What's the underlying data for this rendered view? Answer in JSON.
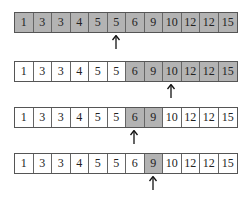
{
  "diagram": {
    "values": [
      1,
      3,
      3,
      4,
      5,
      5,
      6,
      9,
      10,
      12,
      12,
      15
    ],
    "highlight_color": "#b3b3b3",
    "steps": [
      {
        "row_label": "step-1",
        "highlight_range": [
          0,
          11
        ],
        "pointer_index": 5
      },
      {
        "row_label": "step-2",
        "highlight_range": [
          6,
          11
        ],
        "pointer_index": 8
      },
      {
        "row_label": "step-3",
        "highlight_range": [
          6,
          7
        ],
        "pointer_index": 6
      },
      {
        "row_label": "step-4",
        "highlight_range": [
          7,
          7
        ],
        "pointer_index": 7
      }
    ]
  }
}
